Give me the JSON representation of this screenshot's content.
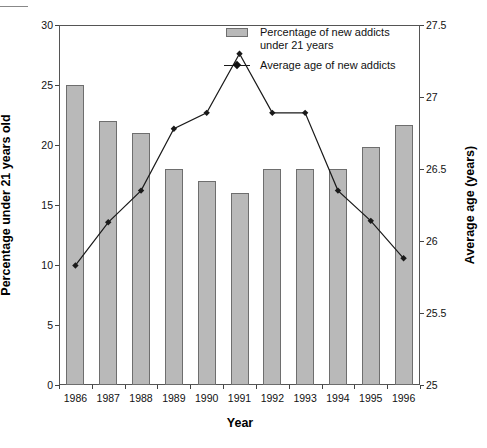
{
  "chart_data": {
    "type": "bar",
    "title": "",
    "xlabel": "Year",
    "ylabel": "Percentage under 21 years old",
    "y2label": "Average age (years)",
    "categories": [
      "1986",
      "1987",
      "1988",
      "1989",
      "1990",
      "1991",
      "1992",
      "1993",
      "1994",
      "1995",
      "1996"
    ],
    "ylim": [
      0,
      30
    ],
    "y_ticks": [
      "0",
      "5",
      "10",
      "15",
      "20",
      "25",
      "30"
    ],
    "y2lim": [
      25,
      27.5
    ],
    "y2_ticks": [
      "25",
      "25.5",
      "26",
      "26.5",
      "27",
      "27.5"
    ],
    "grid": false,
    "legend_position": "top-right",
    "series": [
      {
        "name": "Percentage of new addicts under 21 years",
        "type": "bar",
        "axis": "left",
        "color": "#b9b9b9",
        "edge_color": "#6e6e6e",
        "values": [
          25,
          22,
          21,
          18,
          17,
          16,
          18,
          18,
          18,
          19.8,
          21.7
        ]
      },
      {
        "name": "Average age of new addicts",
        "type": "line",
        "axis": "right",
        "color": "#1a1a1a",
        "marker": "diamond",
        "values": [
          25.83,
          26.13,
          26.35,
          26.78,
          26.89,
          27.3,
          26.89,
          26.89,
          26.35,
          26.14,
          25.88
        ]
      }
    ]
  },
  "legend": {
    "items": [
      {
        "label": "Percentage of new addicts\nunder 21 years",
        "key": "bar-swatch"
      },
      {
        "label": "Average age of new addicts",
        "key": "line-swatch"
      }
    ]
  },
  "axes": {
    "x_title": "Year",
    "y_left_title": "Percentage under 21 years old",
    "y_right_title": "Average age (years)"
  }
}
